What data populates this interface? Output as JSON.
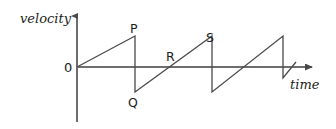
{
  "figure": {
    "kind": "velocity-time-graph",
    "background_color": "#ffffff",
    "ink_color": "#5a5a5a",
    "text_color": "#1c1c1c"
  },
  "axes": {
    "y_label": "velocity",
    "x_label": "time",
    "origin_label": "0",
    "y_axis": {
      "x": 77,
      "top": 12,
      "bottom": 122,
      "arrow": "up"
    },
    "x_axis": {
      "y": 67,
      "left": 77,
      "right": 317,
      "arrow": "right"
    }
  },
  "labels": {
    "p": "P",
    "q": "Q",
    "r": "R",
    "s": "S"
  },
  "chart_data": {
    "type": "line",
    "title": "",
    "xlabel": "time",
    "ylabel": "velocity",
    "grid": false,
    "legend": null,
    "annotations": [
      {
        "name": "P",
        "meaning": "first positive peak before instantaneous drop",
        "x": 135,
        "y_pixel": 36
      },
      {
        "name": "Q",
        "meaning": "negative value immediately after the drop from P",
        "x": 135,
        "y_pixel": 92
      },
      {
        "name": "R",
        "meaning": "zero crossing on the rising ramp between Q and S",
        "x": 173,
        "y_pixel": 67
      },
      {
        "name": "S",
        "meaning": "second positive peak before instantaneous drop",
        "x": 212,
        "y_pixel": 36
      }
    ],
    "series": [
      {
        "name": "velocity",
        "points_pixel": [
          [
            77,
            67
          ],
          [
            135,
            36
          ],
          [
            135,
            92
          ],
          [
            212,
            36
          ],
          [
            212,
            92
          ],
          [
            283,
            36
          ],
          [
            283,
            78
          ],
          [
            296,
            62
          ]
        ]
      }
    ],
    "axis_pixel_ranges": {
      "x": [
        77,
        317
      ],
      "y_zero_pixel": 67
    }
  }
}
